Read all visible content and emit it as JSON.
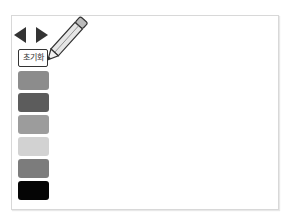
{
  "toolbar": {
    "prev_icon": "triangle-left-icon",
    "next_icon": "triangle-right-icon",
    "reset_label": "초기화",
    "pencil_icon": "pencil-icon"
  },
  "palette": {
    "swatches": [
      {
        "color": "#8c8c8c"
      },
      {
        "color": "#5c5c5c"
      },
      {
        "color": "#9c9c9c"
      },
      {
        "color": "#d2d2d2"
      },
      {
        "color": "#7c7c7c"
      },
      {
        "color": "#050505"
      }
    ]
  }
}
